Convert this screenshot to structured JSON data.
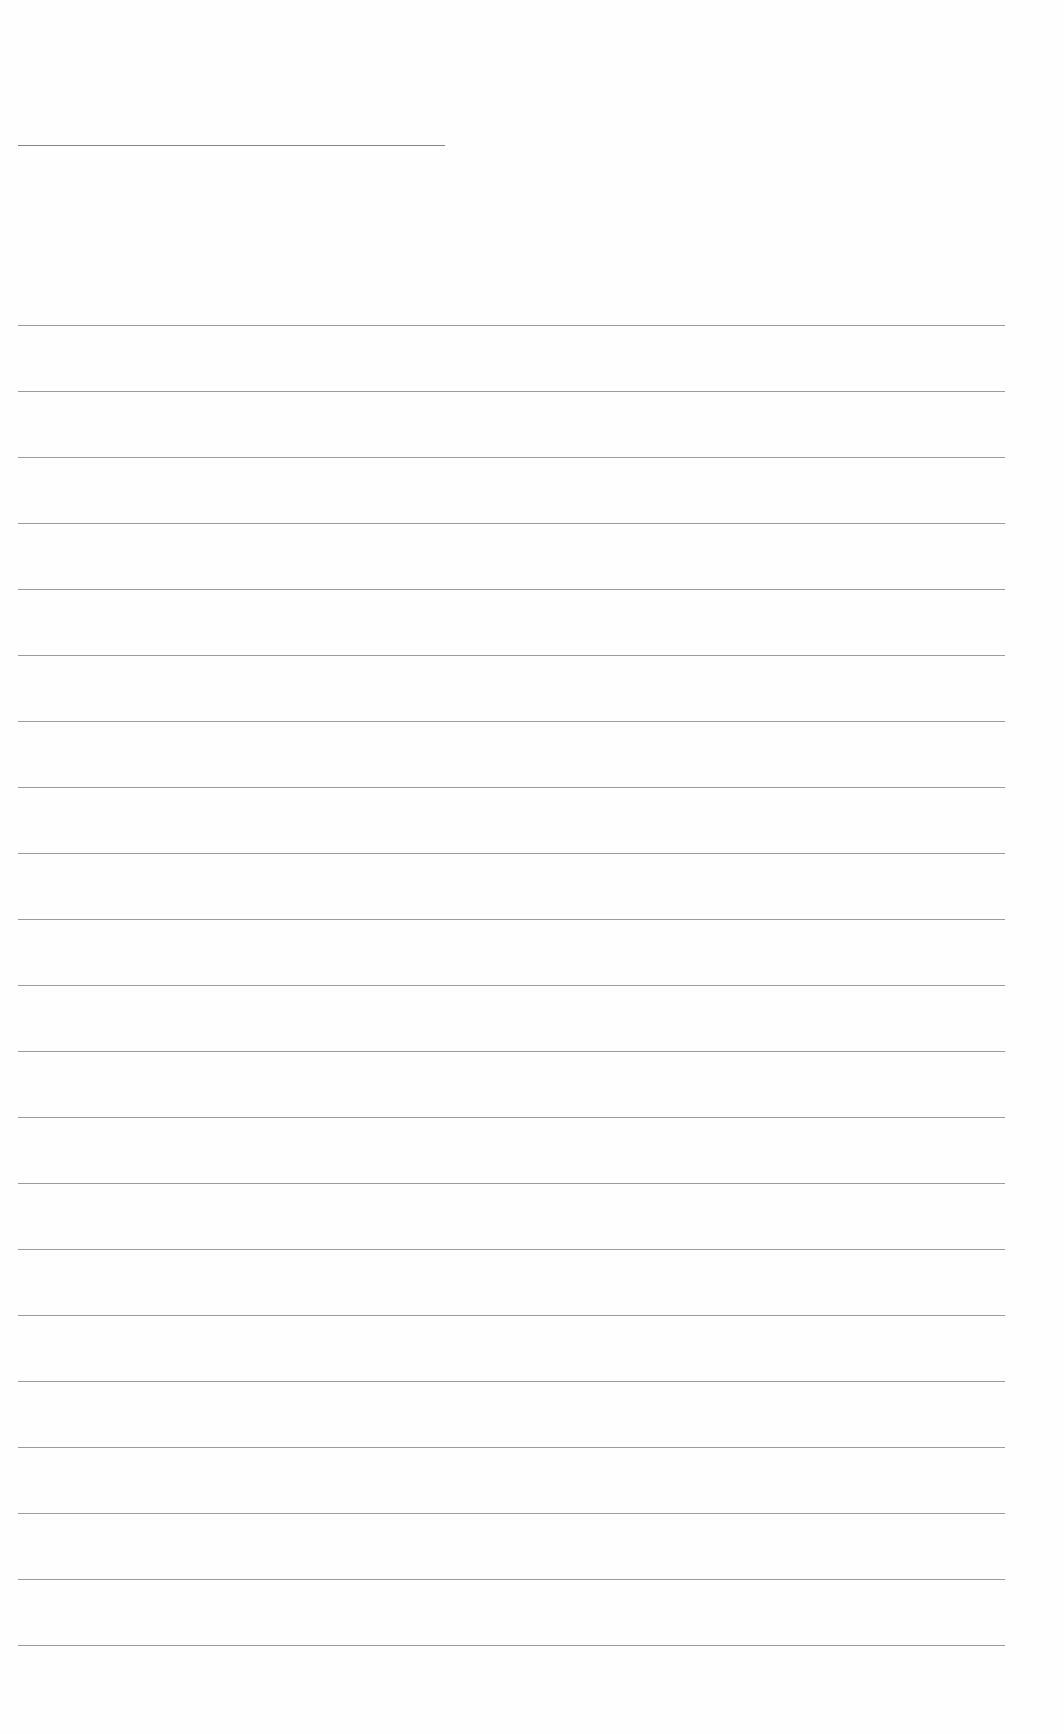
{
  "page": {
    "type": "blank lined paper",
    "background_color": "#fefefe",
    "line_color": "#8a8a8a",
    "header_rule": {
      "left": 18,
      "right": 445,
      "y": 145
    },
    "ruled_lines": {
      "left": 18,
      "right": 1005,
      "first_y": 325,
      "spacing": 66,
      "count": 21
    }
  }
}
